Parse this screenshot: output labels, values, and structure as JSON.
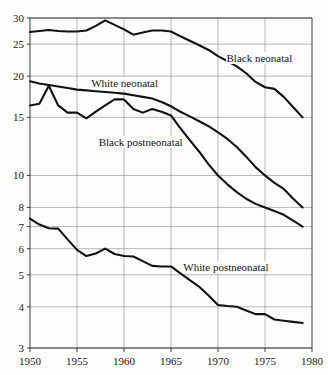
{
  "chart_data": {
    "type": "line",
    "title": "",
    "xlabel": "",
    "ylabel": "",
    "yscale": "log",
    "xlim": [
      1950,
      1980
    ],
    "ylim": [
      3,
      30
    ],
    "grid": true,
    "legend_position": "inline-annotations",
    "x_ticks": [
      "1950",
      "1955",
      "1960",
      "1965",
      "1970",
      "1975",
      "1980"
    ],
    "x_tick_values": [
      1950,
      1955,
      1960,
      1965,
      1970,
      1975,
      1980
    ],
    "y_ticks": [
      "30",
      "25",
      "20",
      "15",
      "10",
      "8",
      "7",
      "6",
      "5",
      "4",
      "3"
    ],
    "y_tick_values": [
      30,
      25,
      20,
      15,
      10,
      8,
      7,
      6,
      5,
      4,
      3
    ],
    "line_color": "#111111",
    "grid_color": "#9a9a9a",
    "axis_color": "#3a3a3a",
    "series": [
      {
        "name": "Black neonatal",
        "label_x": 1970.8,
        "label_y": 22.7,
        "x": [
          1950,
          1951,
          1952,
          1953,
          1954,
          1955,
          1956,
          1957,
          1958,
          1959,
          1960,
          1961,
          1962,
          1963,
          1964,
          1965,
          1966,
          1967,
          1968,
          1969,
          1970,
          1971,
          1972,
          1973,
          1974,
          1975,
          1976,
          1977,
          1978,
          1979
        ],
        "values": [
          27.2,
          27.4,
          27.6,
          27.4,
          27.3,
          27.3,
          27.5,
          28.4,
          29.5,
          28.6,
          27.7,
          26.7,
          27.1,
          27.5,
          27.5,
          27.3,
          26.4,
          25.6,
          24.8,
          24.0,
          23.0,
          22.2,
          21.4,
          20.4,
          19.2,
          18.5,
          18.3,
          17.3,
          16.1,
          15.0
        ]
      },
      {
        "name": "White neonatal",
        "label_x": 1956.4,
        "label_y": 19.1,
        "x": [
          1950,
          1951,
          1952,
          1953,
          1954,
          1955,
          1956,
          1957,
          1958,
          1959,
          1960,
          1961,
          1962,
          1963,
          1964,
          1965,
          1966,
          1967,
          1968,
          1969,
          1970,
          1971,
          1972,
          1973,
          1974,
          1975,
          1976,
          1977,
          1978,
          1979
        ],
        "values": [
          19.3,
          19.0,
          18.8,
          18.6,
          18.4,
          18.2,
          18.1,
          18.0,
          17.9,
          17.8,
          17.7,
          17.5,
          17.3,
          17.1,
          16.7,
          16.2,
          15.6,
          15.1,
          14.6,
          14.1,
          13.5,
          12.9,
          12.2,
          11.4,
          10.6,
          10.0,
          9.5,
          9.1,
          8.5,
          8.0
        ]
      },
      {
        "name": "Black postneonatal",
        "label_x": 1957.2,
        "label_y": 12.6,
        "x": [
          1950,
          1951,
          1952,
          1953,
          1954,
          1955,
          1956,
          1957,
          1958,
          1959,
          1960,
          1961,
          1962,
          1963,
          1964,
          1965,
          1966,
          1967,
          1968,
          1969,
          1970,
          1971,
          1972,
          1973,
          1974,
          1975,
          1976,
          1977,
          1978,
          1979
        ],
        "values": [
          16.3,
          16.5,
          18.7,
          16.3,
          15.5,
          15.5,
          14.9,
          15.6,
          16.3,
          17.0,
          17.0,
          15.9,
          15.5,
          15.9,
          15.6,
          15.2,
          13.9,
          12.8,
          11.8,
          10.8,
          10.0,
          9.4,
          8.9,
          8.5,
          8.2,
          8.0,
          7.8,
          7.6,
          7.3,
          7.0
        ]
      },
      {
        "name": "White postneonatal",
        "label_x": 1966.2,
        "label_y": 5.28,
        "x": [
          1950,
          1951,
          1952,
          1953,
          1954,
          1955,
          1956,
          1957,
          1958,
          1959,
          1960,
          1961,
          1962,
          1963,
          1964,
          1965,
          1966,
          1967,
          1968,
          1969,
          1970,
          1971,
          1972,
          1973,
          1974,
          1975,
          1976,
          1977,
          1978,
          1979
        ],
        "values": [
          7.4,
          7.1,
          6.92,
          6.9,
          6.4,
          5.95,
          5.7,
          5.8,
          6.0,
          5.78,
          5.7,
          5.68,
          5.5,
          5.32,
          5.3,
          5.3,
          5.05,
          4.82,
          4.6,
          4.33,
          4.05,
          4.02,
          4.0,
          3.9,
          3.8,
          3.8,
          3.66,
          3.63,
          3.6,
          3.57
        ]
      }
    ]
  }
}
